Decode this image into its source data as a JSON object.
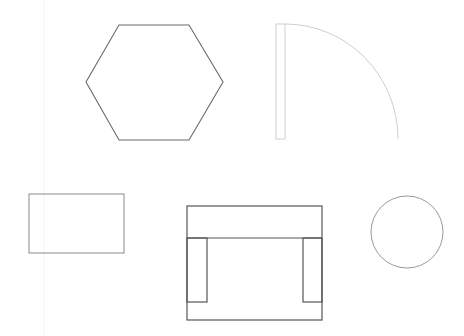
{
  "canvas": {
    "width": 464,
    "height": 336,
    "background": "#ffffff"
  },
  "guide_line": {
    "x": 44,
    "y1": 0,
    "y2": 336,
    "color": "#f4f4f4"
  },
  "shapes": {
    "hexagon": {
      "label": "hexagon",
      "points": "119,25 189,25 223,82 189,140 119,140 86,82",
      "stroke": "#6a6a6a",
      "stroke_width": 1.1
    },
    "door": {
      "label": "door-swing",
      "leaf": {
        "x": 276,
        "y": 24,
        "width": 9,
        "height": 115
      },
      "arc_path": "M285,24 A113,115 0 0 1 398,139",
      "stroke": "#cfcfcf",
      "stroke_width": 1
    },
    "rectangle": {
      "label": "rectangle",
      "x": 29,
      "y": 194,
      "width": 95,
      "height": 59,
      "stroke": "#8a8a8a",
      "stroke_width": 1
    },
    "armchair": {
      "label": "armchair",
      "outer": {
        "x": 187,
        "y": 206,
        "width": 135,
        "height": 114
      },
      "back_line_y": 238,
      "left_arm": {
        "x": 187,
        "y": 238,
        "width": 20,
        "height": 64
      },
      "right_arm": {
        "x": 303,
        "y": 238,
        "width": 19,
        "height": 64
      },
      "stroke": "#555555",
      "stroke_width": 1.2
    },
    "circle": {
      "label": "circle",
      "cx": 407,
      "cy": 232,
      "r": 36,
      "stroke": "#9a9a9a",
      "stroke_width": 1
    }
  }
}
